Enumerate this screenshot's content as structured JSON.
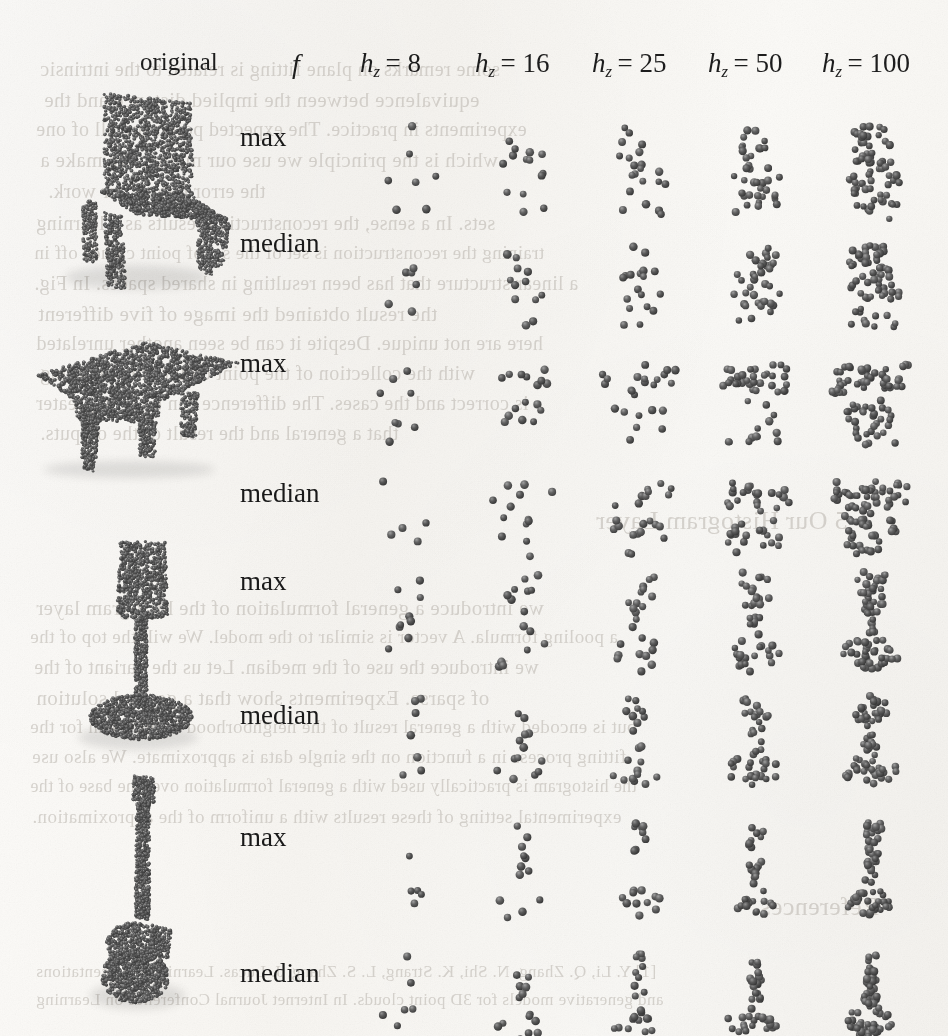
{
  "figure": {
    "kind": "point-cloud-grid",
    "caption_visible": false,
    "background_is_scanned_page": true,
    "point_color": "#454545",
    "text_color": "#1a1a1a",
    "ghost_text_color": "#b9b4ad",
    "column_headers": [
      {
        "id": "original",
        "label": "original",
        "style": "roman",
        "x": 140,
        "y": 48
      },
      {
        "id": "f",
        "label": "f",
        "style": "italic",
        "x": 292,
        "y": 48
      },
      {
        "id": "hz8",
        "label": "h",
        "sub": "z",
        "eq": "= 8",
        "x": 360,
        "y": 48
      },
      {
        "id": "hz16",
        "label": "h",
        "sub": "z",
        "eq": "= 16",
        "x": 475,
        "y": 48
      },
      {
        "id": "hz25",
        "label": "h",
        "sub": "z",
        "eq": "= 25",
        "x": 592,
        "y": 48
      },
      {
        "id": "hz50",
        "label": "h",
        "sub": "z",
        "eq": "= 50",
        "x": 708,
        "y": 48
      },
      {
        "id": "hz100",
        "label": "h",
        "sub": "z",
        "eq": "= 100",
        "x": 822,
        "y": 48
      }
    ],
    "row_labels": [
      {
        "label": "max",
        "y": 122,
        "group": 0
      },
      {
        "label": "median",
        "y": 228,
        "group": 0
      },
      {
        "label": "max",
        "y": 348,
        "group": 1
      },
      {
        "label": "median",
        "y": 478,
        "group": 1
      },
      {
        "label": "max",
        "y": 566,
        "group": 2
      },
      {
        "label": "median",
        "y": 700,
        "group": 2
      },
      {
        "label": "max",
        "y": 822,
        "group": 3
      },
      {
        "label": "median",
        "y": 958,
        "group": 3
      }
    ],
    "originals": [
      {
        "name": "chair",
        "x": 50,
        "y": 82,
        "w": 180,
        "h": 210
      },
      {
        "name": "table",
        "x": 26,
        "y": 330,
        "w": 215,
        "h": 150
      },
      {
        "name": "lamp",
        "x": 66,
        "y": 528,
        "w": 150,
        "h": 225
      },
      {
        "name": "guitar",
        "x": 80,
        "y": 768,
        "w": 120,
        "h": 245
      }
    ]
  },
  "chart_data": {
    "type": "scatter",
    "title": "",
    "xlabel": "",
    "ylabel": "",
    "columns": [
      "original",
      "f",
      "h_z = 8",
      "h_z = 16",
      "h_z = 25",
      "h_z = 50",
      "h_z = 100"
    ],
    "hz_values": [
      8,
      16,
      25,
      50,
      100
    ],
    "pooling_rows": [
      "max",
      "median"
    ],
    "objects": [
      "chair",
      "table",
      "lamp",
      "guitar"
    ],
    "point_counts_per_cell": {
      "hz8": [
        7,
        6,
        8,
        5,
        9,
        7,
        5,
        6
      ],
      "hz16": [
        14,
        12,
        16,
        13,
        15,
        13,
        12,
        14
      ],
      "hz25": [
        21,
        18,
        24,
        22,
        23,
        21,
        19,
        22
      ],
      "hz50": [
        40,
        36,
        44,
        42,
        43,
        40,
        35,
        41
      ],
      "hz100": [
        72,
        66,
        80,
        76,
        78,
        74,
        64,
        75
      ]
    },
    "grid": false,
    "legend": "none"
  },
  "ghost_lines": [
    {
      "t": "some remarks on plane fitting is related to the intrinsic",
      "x": 40,
      "y": 58,
      "s": 20
    },
    {
      "t": "equivalence between the implied distance and the",
      "x": 44,
      "y": 88,
      "s": 21
    },
    {
      "t": "experiments in practice. The expected points are all of one",
      "x": 36,
      "y": 118,
      "s": 20
    },
    {
      "t": "which is the principle we use our model. We make a",
      "x": 40,
      "y": 148,
      "s": 21
    },
    {
      "t": "the error before our work.",
      "x": 48,
      "y": 180,
      "s": 20
    },
    {
      "t": "sets. In a sense, the reconstruction results as a learning",
      "x": 36,
      "y": 212,
      "s": 20
    },
    {
      "t": "training the reconstruction is set of the set of point clouds off in",
      "x": 34,
      "y": 242,
      "s": 19
    },
    {
      "t": "a linear structure that has been resulting in shared spaces. In Fig.",
      "x": 34,
      "y": 272,
      "s": 20
    },
    {
      "t": "the result obtained the image of five different",
      "x": 38,
      "y": 302,
      "s": 21
    },
    {
      "t": "here are not unique. Despite it can be seen another unrelated",
      "x": 36,
      "y": 332,
      "s": 20
    },
    {
      "t": "with the collection of the point cloud's max-pooling",
      "x": 40,
      "y": 362,
      "s": 20
    },
    {
      "t": "is correct and the cases. The difference can be seen greater",
      "x": 36,
      "y": 392,
      "s": 20
    },
    {
      "t": "that a general and the result of the outputs.",
      "x": 40,
      "y": 422,
      "s": 20
    },
    {
      "t": "5    Our Histogram Layer",
      "x": 596,
      "y": 506,
      "s": 26
    },
    {
      "t": "we introduce a general formulation of the histogram layer",
      "x": 36,
      "y": 596,
      "s": 21
    },
    {
      "t": "a pooling formula. A vector is similar to the model. We will the top of the",
      "x": 30,
      "y": 626,
      "s": 19
    },
    {
      "t": "we introduce the use of the median. Let us the variant of the",
      "x": 34,
      "y": 656,
      "s": 20
    },
    {
      "t": "of sparse. Experiments show that a general solution",
      "x": 36,
      "y": 686,
      "s": 21
    },
    {
      "t": "but is encoded with a general result of the neighborhood in the mean for the",
      "x": 30,
      "y": 716,
      "s": 19
    },
    {
      "t": "fitting process in a function on the single data is approximate. We also use",
      "x": 32,
      "y": 746,
      "s": 19
    },
    {
      "t": "the histogram is practically used with a general formulation over the base of the",
      "x": 30,
      "y": 776,
      "s": 18
    },
    {
      "t": "experimental setting of these results with a uniform of the approximation.",
      "x": 32,
      "y": 806,
      "s": 19
    },
    {
      "t": "References",
      "x": 760,
      "y": 892,
      "s": 26
    },
    {
      "t": "[1]  Y. Li, Q. Zhang, N. Shi, K. Strang, L. S. Zhang, J. Lucas. Learning representations",
      "x": 36,
      "y": 962,
      "s": 17
    },
    {
      "t": "and generative models for 3D point clouds. In Internet Journal Conference on Learning",
      "x": 36,
      "y": 990,
      "s": 17
    }
  ]
}
